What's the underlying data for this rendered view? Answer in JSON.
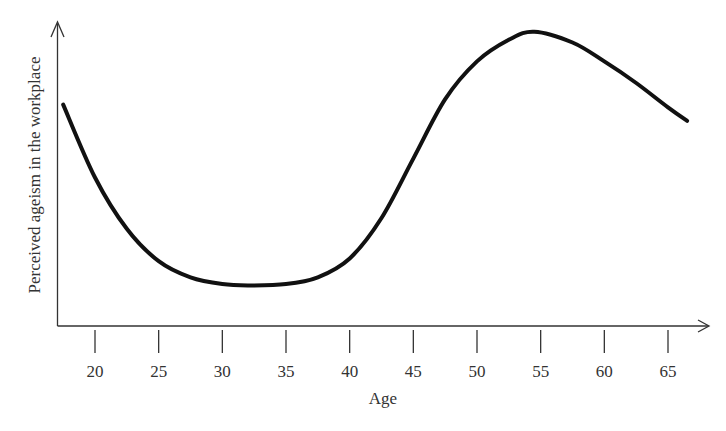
{
  "chart_data": {
    "type": "line",
    "title": "",
    "xlabel": "Age",
    "ylabel": "Perceived ageism in the workplace",
    "x_ticks": [
      20,
      25,
      30,
      35,
      40,
      45,
      50,
      55,
      60,
      65
    ],
    "x_tick_labels": [
      "20",
      "25",
      "30",
      "35",
      "40",
      "45",
      "50",
      "55",
      "60",
      "65"
    ],
    "xlim": [
      17.5,
      67
    ],
    "y_ticks": [],
    "grid": false,
    "legend": null,
    "series": [
      {
        "name": "Perceived ageism",
        "x": [
          17.5,
          20,
          22.5,
          25,
          27.5,
          30,
          32,
          35,
          37.5,
          40,
          42.5,
          45,
          47.5,
          50,
          52.5,
          54.5,
          57.5,
          60,
          62.5,
          65,
          66.5
        ],
        "y": [
          0.82,
          0.55,
          0.36,
          0.24,
          0.18,
          0.155,
          0.15,
          0.155,
          0.18,
          0.25,
          0.4,
          0.62,
          0.84,
          0.98,
          1.06,
          1.09,
          1.05,
          0.98,
          0.9,
          0.81,
          0.76
        ]
      }
    ],
    "y_scale_note": "Unlabeled y-axis; values normalized (0 = x-axis, 1 ≈ near top)"
  }
}
